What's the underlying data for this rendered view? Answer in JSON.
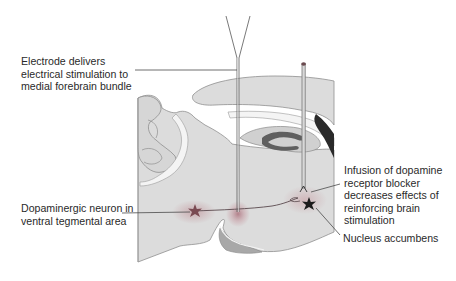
{
  "figure": {
    "type": "anatomical-diagram"
  },
  "labels": {
    "electrode": "Electrode delivers\nelectrical stimulation to\nmedial forebrain bundle",
    "dopaminergic_neuron": "Dopaminergic neuron in\nventral tegmental area",
    "infusion": "Infusion of dopamine\nreceptor blocker\ndecreases effects of\nreinforcing brain\nstimulation",
    "nucleus_accumbens": "Nucleus accumbens"
  },
  "colors": {
    "brain_fill": "#dcdcdc",
    "brain_outline": "#8a8a8a",
    "white_matter": "#f4f4f4",
    "dark_structure": "#5a5a5a",
    "black_structure": "#2a2a2a",
    "highlight_halo": "#c9a9ad",
    "neuron_star_vta": "#7a4a52",
    "neuron_star_nacc": "#1c1c1c",
    "leader_line": "#4a4a4a",
    "text": "#2a2a2a"
  }
}
